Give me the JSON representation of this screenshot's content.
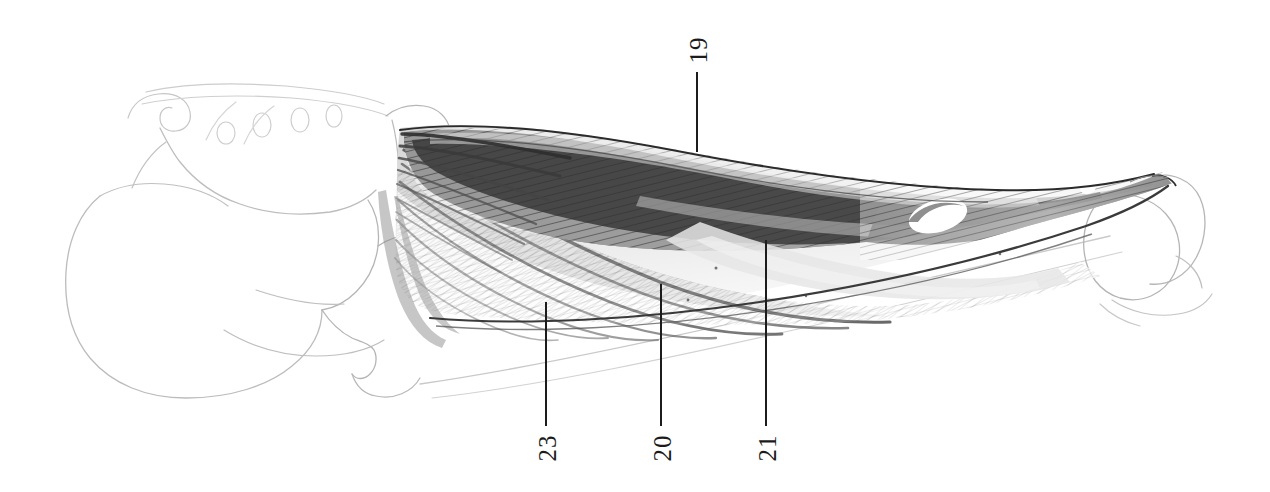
{
  "plate": {
    "title": "Lateral view of hip and thigh musculature",
    "medium": "graphite pencil drawing",
    "background_color": "#ffffff",
    "ink_color": "#1c1c1c",
    "width": 1270,
    "height": 492
  },
  "labels": [
    {
      "id": "label-19",
      "text": "19",
      "text_x": 697,
      "text_y": 52,
      "line_x": 697,
      "line_top": 72,
      "line_bottom": 152,
      "orientation": "rotated-90",
      "points_to": "upper dark muscle belly"
    },
    {
      "id": "label-23",
      "text": "23",
      "text_x": 546,
      "text_y": 450,
      "line_x": 546,
      "line_top": 302,
      "line_bottom": 426,
      "orientation": "rotated-90",
      "points_to": "anterior fan-shaped muscle bundle"
    },
    {
      "id": "label-20",
      "text": "20",
      "text_x": 661,
      "text_y": 450,
      "line_x": 661,
      "line_top": 284,
      "line_bottom": 426,
      "orientation": "rotated-90",
      "points_to": "middle muscle bundle"
    },
    {
      "id": "label-21",
      "text": "21",
      "text_x": 766,
      "text_y": 450,
      "line_x": 766,
      "line_top": 240,
      "line_bottom": 426,
      "orientation": "rotated-90",
      "points_to": "pale tendinous sheet"
    }
  ],
  "figure_parts": [
    {
      "name": "pelvis-outline",
      "style": "faint outline",
      "region": "left"
    },
    {
      "name": "sacrum-foramina",
      "style": "faint outline",
      "region": "upper-left"
    },
    {
      "name": "ischium-outline",
      "style": "faint outline",
      "region": "lower-left"
    },
    {
      "name": "femur-shaft",
      "style": "faint outline",
      "region": "center-lower"
    },
    {
      "name": "femoral-condyles",
      "style": "faint outline",
      "region": "right"
    },
    {
      "name": "muscle-mass",
      "style": "dense hatching",
      "region": "center"
    },
    {
      "name": "muscle-window",
      "style": "white ellipse",
      "region": "right-of-center"
    }
  ]
}
